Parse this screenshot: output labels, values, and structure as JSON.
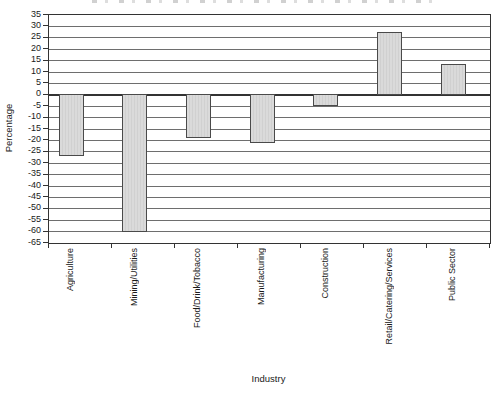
{
  "chart_data": {
    "type": "bar",
    "categories": [
      "Agriculture",
      "Mining/Utilities",
      "Food/Drink/Tobacco",
      "Manufacturing",
      "Construction",
      "Retail/Catering/Services",
      "Public Sector"
    ],
    "values": [
      -27,
      -60,
      -19,
      -21,
      -5,
      27,
      13
    ],
    "title": "",
    "xlabel": "Industry",
    "ylabel": "Percentage",
    "ylim": [
      -65,
      35
    ],
    "ytick_step": 5,
    "yticks": [
      35,
      30,
      25,
      20,
      15,
      10,
      5,
      0,
      -5,
      -10,
      -15,
      -20,
      -25,
      -30,
      -35,
      -40,
      -45,
      -50,
      -55,
      -60,
      -65
    ],
    "grid": true,
    "legend": "none"
  },
  "colors": {
    "bar_fill": "#d9d9d9",
    "bar_border": "#4a4a4a",
    "gridline": "#6e6e6e",
    "axis": "#333333",
    "text": "#1a1a1a",
    "background": "#ffffff"
  }
}
